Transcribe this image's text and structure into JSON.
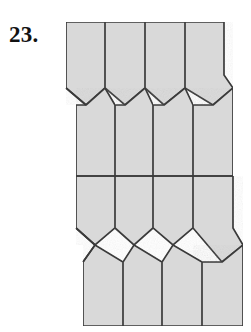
{
  "figure": {
    "problem_label": "23.",
    "caption": "",
    "type": "tessellation-diagram",
    "colors": {
      "tile_fill": "#d9d9d9",
      "tile_stroke": "#3a3a3a",
      "background": "#ffffff",
      "label_color": "#121212"
    },
    "stroke_width": 1.7,
    "geometry": {
      "canvas": {
        "width": 251,
        "height": 332
      },
      "column_x_top": [
        66,
        105,
        145,
        185,
        224
      ],
      "column_x_mid": [
        76,
        115,
        153,
        193,
        233
      ],
      "column_x_bottom": [
        83,
        123,
        162,
        202,
        243
      ],
      "top_edge_y": 22,
      "band1_peak_y": 88,
      "band1_trough_y": 105,
      "midline_y": 176,
      "band2_peak_y": 245,
      "band2_trough_y": 262,
      "bottom_edge_y": 326
    },
    "tiles": [
      {
        "name": "top-col-1",
        "row": "top",
        "col": 1,
        "points": "66,22 105,22 105,88 86,105 66,88"
      },
      {
        "name": "top-col-2",
        "row": "top",
        "col": 2,
        "points": "105,22 145,22 145,88 125,105 105,88"
      },
      {
        "name": "top-col-3",
        "row": "top",
        "col": 3,
        "points": "145,22 185,22 185,88 164,105 145,88"
      },
      {
        "name": "top-col-4",
        "row": "top",
        "col": 4,
        "points": "185,22 224,22 224,75 233,88 213,105 185,88"
      },
      {
        "name": "mid-col-1",
        "row": "middle",
        "col": 1,
        "points": "86,105 105,88 115,105 115,176 76,176 76,105"
      },
      {
        "name": "mid-col-2",
        "row": "middle",
        "col": 2,
        "points": "125,105 145,88 153,105 153,176 115,176 115,105"
      },
      {
        "name": "mid-col-3",
        "row": "middle",
        "col": 3,
        "points": "164,105 185,88 193,105 193,176 153,176 153,105"
      },
      {
        "name": "mid-col-4",
        "row": "middle",
        "col": 4,
        "points": "213,105 233,88 233,176 193,176 193,105"
      },
      {
        "name": "low-col-1",
        "row": "lower",
        "col": 1,
        "points": "76,176 115,176 115,228 95,245 76,228"
      },
      {
        "name": "low-col-2",
        "row": "lower",
        "col": 2,
        "points": "115,176 153,176 153,228 134,245 115,228"
      },
      {
        "name": "low-col-3",
        "row": "lower",
        "col": 3,
        "points": "153,176 193,176 193,228 173,245 153,228"
      },
      {
        "name": "low-col-4",
        "row": "lower",
        "col": 4,
        "points": "193,176 233,176 233,228 243,245 222,262 193,228"
      },
      {
        "name": "bottom-col-1",
        "row": "bottom",
        "col": 1,
        "points": "95,245 123,262 123,326 83,326 83,262"
      },
      {
        "name": "bottom-col-2",
        "row": "bottom",
        "col": 2,
        "points": "134,245 162,262 162,326 123,326 123,262"
      },
      {
        "name": "bottom-col-3",
        "row": "bottom",
        "col": 3,
        "points": "173,245 202,262 202,326 162,326 162,262"
      },
      {
        "name": "bottom-col-4",
        "row": "bottom",
        "col": 4,
        "points": "222,262 243,245 243,326 202,326 202,262"
      }
    ],
    "extra_edges": [
      {
        "name": "left-notch-band1",
        "points": "66,88 86,105"
      },
      {
        "name": "midline-full",
        "points": "76,176 233,176"
      },
      {
        "name": "bottom-left-notch",
        "points": "76,228 95,245 83,262"
      }
    ]
  }
}
